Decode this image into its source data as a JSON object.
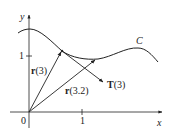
{
  "diagram": {
    "axes": {
      "x_label": "x",
      "y_label": "y",
      "origin_label": "0",
      "x_tick_label": "1",
      "y_tick_label": "1"
    },
    "curve": {
      "label": "C"
    },
    "vectors": [
      {
        "id": "r3",
        "bold": "r",
        "arg": "(3)"
      },
      {
        "id": "r32",
        "bold": "r",
        "arg": "(3.2)"
      },
      {
        "id": "T3",
        "bold": "T",
        "arg": "(3)"
      }
    ],
    "colors": {
      "ink": "#222222",
      "background": "#ffffff"
    }
  }
}
